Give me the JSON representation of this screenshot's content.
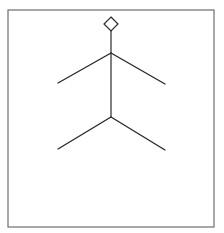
{
  "diagram": {
    "type": "line-drawing",
    "background": "#ffffff",
    "stroke_color": "#2a2a2a",
    "border_color": "#6e6e6e",
    "frame": {
      "x": 8,
      "y": 10,
      "width": 206,
      "height": 217
    },
    "top_marker": {
      "shape": "diamond",
      "cx": 111,
      "cy": 24,
      "half_size": 7
    },
    "stem": {
      "x": 111,
      "y1": 31,
      "y2": 117
    },
    "branches": [
      {
        "name": "upper",
        "vertex": [
          111,
          53
        ],
        "left_end": [
          58,
          83
        ],
        "right_end": [
          165,
          84
        ]
      },
      {
        "name": "lower",
        "vertex": [
          111,
          117
        ],
        "left_end": [
          58,
          149
        ],
        "right_end": [
          165,
          150
        ]
      }
    ]
  }
}
